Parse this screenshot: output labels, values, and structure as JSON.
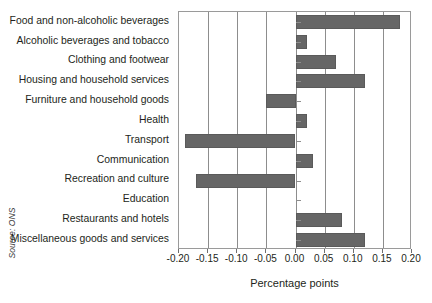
{
  "chart_data": {
    "type": "bar",
    "orientation": "horizontal",
    "title": "",
    "subtitle": "",
    "xlabel": "Percentage points",
    "ylabel": "",
    "xlim": [
      -0.2,
      0.2
    ],
    "xticks": [
      "-0.20",
      "-0.15",
      "-0.10",
      "-0.05",
      "0.00",
      "0.05",
      "0.10",
      "0.15",
      "0.20"
    ],
    "xtick_values": [
      -0.2,
      -0.15,
      -0.1,
      -0.05,
      0.0,
      0.05,
      0.1,
      0.15,
      0.2
    ],
    "grid": true,
    "legend": "none",
    "bar_color": "#666666",
    "categories": [
      "Food and non-alcoholic beverages",
      "Alcoholic beverages and tobacco",
      "Clothing and footwear",
      "Housing and household services",
      "Furniture and household goods",
      "Health",
      "Transport",
      "Communication",
      "Recreation and culture",
      "Education",
      "Restaurants and hotels",
      "Miscellaneous goods and services"
    ],
    "values": [
      0.18,
      0.02,
      0.07,
      0.12,
      -0.05,
      0.02,
      -0.19,
      0.03,
      -0.17,
      0.0,
      0.08,
      0.12
    ],
    "source": "Source: ONS"
  }
}
